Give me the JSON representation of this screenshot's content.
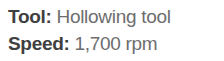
{
  "panel": {
    "rows": [
      {
        "label": "Tool:",
        "value": "Hollowing tool"
      },
      {
        "label": "Speed:",
        "value": "1,700 rpm"
      }
    ]
  },
  "colors": {
    "background": "#ffffff",
    "label_text": "#3f3f3f",
    "value_text": "#6d6d6d"
  }
}
